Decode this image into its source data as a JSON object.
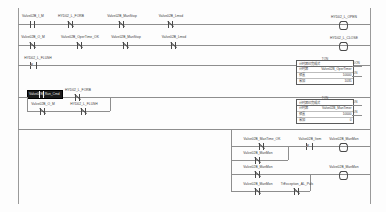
{
  "app": {
    "type": "plc-ladder-logic-editor",
    "view": "ladder-diagram"
  },
  "colors": {
    "background": "#fdfdfd",
    "rail": "#9a9a9a",
    "wire": "#8e8e8e",
    "text": "#3a3a3a",
    "selection_bg": "#1b1b1b",
    "selection_fg": "#e8e8e8"
  },
  "rungs": [
    {
      "id": "rung-1",
      "contacts": [
        {
          "label": "Valve02B_I_M",
          "type": "no"
        },
        {
          "label": "HYD02_L_FORB",
          "type": "nc"
        },
        {
          "label": "Valve02B_ManStop",
          "type": "nc"
        },
        {
          "label": "Valve02B_Lmsd",
          "type": "nc"
        }
      ],
      "coil": {
        "label": "HYD02_L_OPEN",
        "type": "coil"
      }
    },
    {
      "id": "rung-2",
      "contacts": [
        {
          "label": "Valve02B_O_M",
          "type": "no"
        },
        {
          "label": "Valve02B_OperTime_OK",
          "type": "nc"
        },
        {
          "label": "Valve02B_ManStop",
          "type": "nc"
        },
        {
          "label": "Valve02B_Lmsd",
          "type": "nc"
        }
      ],
      "coil": {
        "label": "HYD02_L_CLOSE",
        "type": "coil"
      }
    },
    {
      "id": "rung-3",
      "contacts": [
        {
          "label": "HYD02_L_FLUSH",
          "type": "pulse"
        }
      ]
    },
    {
      "id": "rung-4",
      "selected_contact": {
        "label": "Valve02B_Run_Cmd",
        "selected": true
      },
      "contacts": [
        {
          "label": "HYD02_L_FORB",
          "type": "nc"
        }
      ],
      "branch_contacts": [
        {
          "label": "Valve02B_O_M",
          "type": "no"
        },
        {
          "label": "HYD02_L_FLUSH",
          "type": "nc"
        }
      ]
    },
    {
      "id": "rung-5",
      "contacts": [
        {
          "label": "Valve02B_ManTime_OK",
          "type": "nc"
        },
        {
          "label": "Valve02B_Item",
          "type": "pulse"
        }
      ],
      "branch_contacts": [
        {
          "label": "Valve02B_ManMon",
          "type": "nc"
        }
      ],
      "coil": {
        "label": "Valve02B_ManMon",
        "type": "coil"
      }
    },
    {
      "id": "rung-6",
      "contacts": [
        {
          "label": "Valve02B_ManMon",
          "type": "nc"
        }
      ],
      "branch_contacts": [
        {
          "label": "Valve02B_ManMon",
          "type": "nc"
        },
        {
          "label": "TrException_AL_Puls",
          "type": "nc"
        }
      ],
      "coil": {
        "label": "Valve02B_ManMon",
        "type": "coil"
      }
    }
  ],
  "function_blocks": [
    {
      "id": "fb-timer-1",
      "title": "TON",
      "rows": [
        {
          "name": "计时器已完成式",
          "value": ""
        },
        {
          "name": "计时器",
          "value": "Valve02B_OperTimer"
        },
        {
          "name": "预置",
          "value": "10000"
        },
        {
          "name": "累加",
          "value": "1035"
        }
      ],
      "pins": [
        {
          "label": "DON",
          "side": "right"
        },
        {
          "label": "DN",
          "side": "right"
        }
      ]
    },
    {
      "id": "fb-timer-2",
      "title": "TON",
      "rows": [
        {
          "name": "计时器已完成式",
          "value": ""
        },
        {
          "name": "计时器",
          "value": "Valve02B_ManTimer"
        },
        {
          "name": "预置",
          "value": "10000"
        },
        {
          "name": "累加",
          "value": "0"
        }
      ],
      "pins": [
        {
          "label": "DN",
          "side": "right"
        },
        {
          "label": "DN",
          "side": "right"
        }
      ]
    }
  ]
}
